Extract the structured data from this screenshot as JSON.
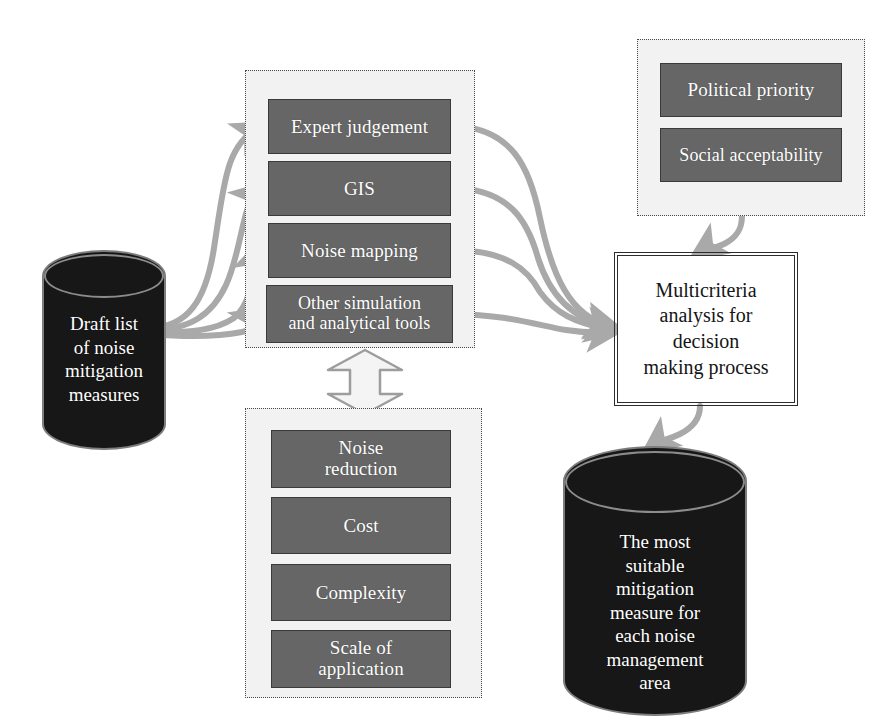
{
  "diagram": {
    "colors": {
      "box_fill": "#666666",
      "box_border": "#3a3a3a",
      "group_fill": "#f2f2f2",
      "group_border": "#4a4a4a",
      "arrow": "#a9a9a9",
      "cylinder_fill": "#171717",
      "cylinder_edge": "#8c8c8c",
      "process_border": "#2c2c2c",
      "text_light": "#ffffff",
      "text_dark": "#151515"
    },
    "source": {
      "name": "draft-list-cylinder",
      "label": "Draft list\nof noise\nmitigation\nmeasures",
      "lines": [
        "Draft list",
        "of noise",
        "mitigation",
        "measures"
      ]
    },
    "tools_group": {
      "name": "assessment-tools-group",
      "items": [
        {
          "label": "Expert judgement",
          "lines": [
            "Expert judgement"
          ]
        },
        {
          "label": "GIS",
          "lines": [
            "GIS"
          ]
        },
        {
          "label": "Noise mapping",
          "lines": [
            "Noise mapping"
          ]
        },
        {
          "label": "Other simulation and analytical tools",
          "lines": [
            "Other simulation",
            "and analytical tools"
          ]
        }
      ]
    },
    "criteria_group": {
      "name": "criteria-group",
      "items": [
        {
          "label": "Noise reduction",
          "lines": [
            "Noise",
            "reduction"
          ]
        },
        {
          "label": "Cost",
          "lines": [
            "Cost"
          ]
        },
        {
          "label": "Complexity",
          "lines": [
            "Complexity"
          ]
        },
        {
          "label": "Scale of application",
          "lines": [
            "Scale of",
            "application"
          ]
        }
      ]
    },
    "factors_group": {
      "name": "external-factors-group",
      "items": [
        {
          "label": "Political priority",
          "lines": [
            "Political priority"
          ]
        },
        {
          "label": "Social acceptability",
          "lines": [
            "Social acceptability"
          ]
        }
      ]
    },
    "process": {
      "name": "multicriteria-analysis-box",
      "label": "Multicriteria analysis for decision making process",
      "lines": [
        "Multicriteria",
        "analysis for",
        "decision",
        "making process"
      ]
    },
    "result": {
      "name": "result-cylinder",
      "label": "The most suitable mitigation measure for each noise management area",
      "lines": [
        "The most",
        "suitable",
        "mitigation",
        "measure for",
        "each noise",
        "management",
        "area"
      ]
    },
    "connectors": [
      {
        "name": "source-to-expert-judgement",
        "style": "curved-arrow"
      },
      {
        "name": "source-to-gis",
        "style": "curved-arrow"
      },
      {
        "name": "source-to-noise-mapping",
        "style": "curved-arrow"
      },
      {
        "name": "source-to-other-tools",
        "style": "curved-arrow"
      },
      {
        "name": "expert-judgement-to-analysis",
        "style": "curved-arrow"
      },
      {
        "name": "gis-to-analysis",
        "style": "curved-arrow"
      },
      {
        "name": "noise-mapping-to-analysis",
        "style": "curved-arrow"
      },
      {
        "name": "other-tools-to-analysis",
        "style": "curved-arrow"
      },
      {
        "name": "factors-to-analysis",
        "style": "curved-arrow"
      },
      {
        "name": "analysis-to-result",
        "style": "curved-arrow"
      },
      {
        "name": "tools-criteria-double-arrow",
        "style": "double-headed-block-arrow"
      }
    ]
  }
}
